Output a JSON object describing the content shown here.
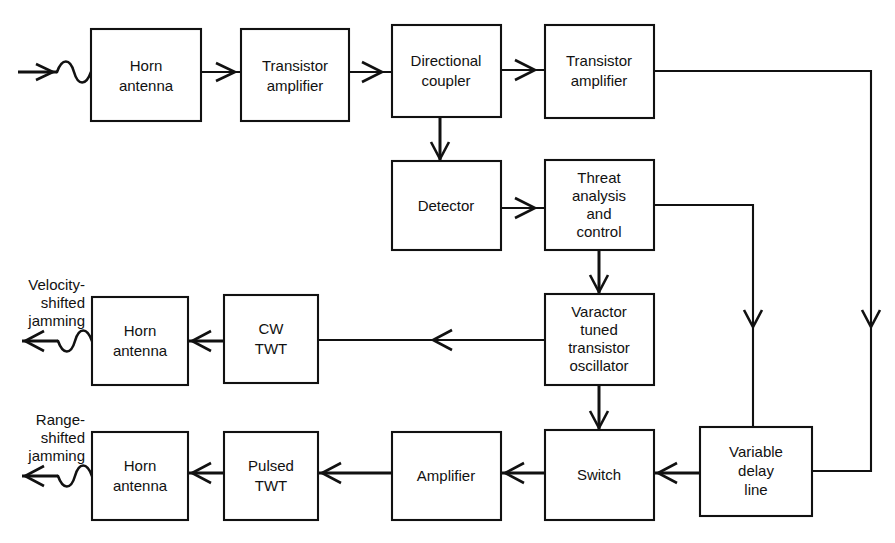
{
  "diagram": {
    "type": "block-diagram",
    "background_color": "#ffffff",
    "line_color": "#111111",
    "blocks": [
      {
        "id": "horn_in",
        "label": "Horn\nantenna",
        "lines": [
          "Horn",
          "antenna"
        ],
        "x": 91,
        "y": 29,
        "w": 110,
        "h": 92
      },
      {
        "id": "amp1",
        "label": "Transistor\namplifier",
        "lines": [
          "Transistor",
          "amplifier"
        ],
        "x": 241,
        "y": 29,
        "w": 108,
        "h": 92
      },
      {
        "id": "dircoupler",
        "label": "Directional\ncoupler",
        "lines": [
          "Directional",
          "coupler"
        ],
        "x": 392,
        "y": 25,
        "w": 109,
        "h": 92
      },
      {
        "id": "amp2",
        "label": "Transistor\namplifier",
        "lines": [
          "Transistor",
          "amplifier"
        ],
        "x": 545,
        "y": 25,
        "w": 109,
        "h": 93
      },
      {
        "id": "detector",
        "label": "Detector",
        "lines": [
          "Detector"
        ],
        "x": 392,
        "y": 161,
        "w": 109,
        "h": 89
      },
      {
        "id": "threat",
        "label": "Threat\nanalysis\nand\ncontrol",
        "lines": [
          "Threat",
          "analysis",
          "and",
          "control"
        ],
        "x": 545,
        "y": 160,
        "w": 109,
        "h": 90
      },
      {
        "id": "horn_vel",
        "label": "Horn\nantenna",
        "lines": [
          "Horn",
          "antenna"
        ],
        "x": 92,
        "y": 297,
        "w": 96,
        "h": 88
      },
      {
        "id": "cw_twt",
        "label": "CW\nTWT",
        "lines": [
          "CW",
          "TWT"
        ],
        "x": 224,
        "y": 295,
        "w": 94,
        "h": 88
      },
      {
        "id": "varactor",
        "label": "Varactor\ntuned\ntransistor\noscillator",
        "lines": [
          "Varactor",
          "tuned",
          "transistor",
          "oscillator"
        ],
        "x": 545,
        "y": 294,
        "w": 109,
        "h": 91
      },
      {
        "id": "horn_rng",
        "label": "Horn\nantenna",
        "lines": [
          "Horn",
          "antenna"
        ],
        "x": 92,
        "y": 432,
        "w": 96,
        "h": 88
      },
      {
        "id": "pulsed_twt",
        "label": "Pulsed\nTWT",
        "lines": [
          "Pulsed",
          "TWT"
        ],
        "x": 224,
        "y": 432,
        "w": 94,
        "h": 88
      },
      {
        "id": "amplifier",
        "label": "Amplifier",
        "lines": [
          "Amplifier"
        ],
        "x": 392,
        "y": 432,
        "w": 109,
        "h": 88
      },
      {
        "id": "switch",
        "label": "Switch",
        "lines": [
          "Switch"
        ],
        "x": 545,
        "y": 430,
        "w": 109,
        "h": 90
      },
      {
        "id": "delay_line",
        "label": "Variable\ndelay\nline",
        "lines": [
          "Variable",
          "delay",
          "line"
        ],
        "x": 700,
        "y": 427,
        "w": 112,
        "h": 89
      }
    ],
    "edge_labels": [
      {
        "id": "velocity_jamming",
        "lines": [
          "Velocity-",
          "shifted",
          "jamming"
        ],
        "x": 85,
        "y": 285
      },
      {
        "id": "range_jamming",
        "lines": [
          "Range-",
          "shifted",
          "jamming"
        ],
        "x": 85,
        "y": 420
      }
    ],
    "ports": {
      "rf_input": {
        "label": "",
        "direction": "in"
      },
      "velocity_output": {
        "label": "Velocity-shifted jamming",
        "direction": "out"
      },
      "range_output": {
        "label": "Range-shifted jamming",
        "direction": "out"
      }
    }
  }
}
